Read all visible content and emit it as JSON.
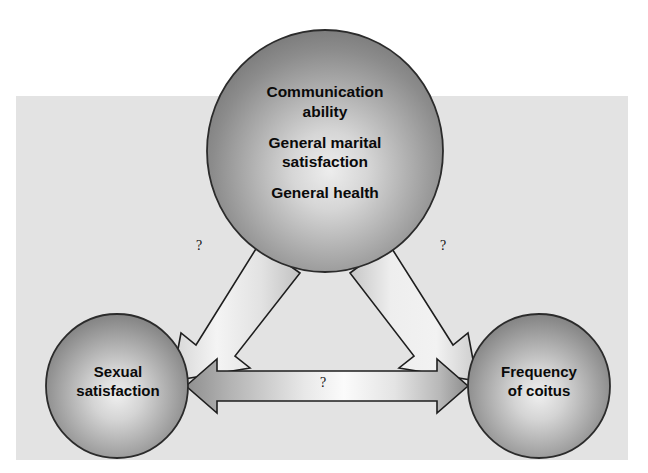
{
  "figure": {
    "background_color": "#ffffff",
    "panel_color": "#e3e3e3",
    "node_fill_dark": "#7d7d7d",
    "node_fill_light": "#d8d8d8",
    "node_stroke": "#2b2b2b",
    "arrow_fill_light": "#f2f2f2",
    "arrow_fill_dark": "#9a9a9a",
    "arrow_stroke": "#1e1e1e",
    "text_color": "#0a0a0a"
  },
  "nodes": {
    "top": {
      "name": "predictors-node",
      "lines": [
        "Communication ability",
        "General marital satisfaction",
        "General health"
      ],
      "line1": "Communication",
      "line1b": "ability",
      "line2": "General marital",
      "line2b": "satisfaction",
      "line3": "General health"
    },
    "bottom_left": {
      "name": "sexual-satisfaction-node",
      "line1": "Sexual",
      "line2": "satisfaction",
      "full": "Sexual satisfaction"
    },
    "bottom_right": {
      "name": "frequency-of-coitus-node",
      "line1": "Frequency",
      "line2": "of coitus",
      "full": "Frequency of coitus"
    }
  },
  "arrows": {
    "top_to_left": {
      "name": "arrow-top-to-sexual-satisfaction",
      "label": "?",
      "direction": "one-way",
      "from": "Communication ability / General marital satisfaction / General health",
      "to": "Sexual satisfaction"
    },
    "top_to_right": {
      "name": "arrow-top-to-frequency-of-coitus",
      "label": "?",
      "direction": "one-way",
      "from": "Communication ability / General marital satisfaction / General health",
      "to": "Frequency of coitus"
    },
    "left_right": {
      "name": "arrow-sexual-satisfaction-frequency",
      "label": "?",
      "direction": "two-way",
      "from": "Sexual satisfaction",
      "to": "Frequency of coitus"
    }
  }
}
